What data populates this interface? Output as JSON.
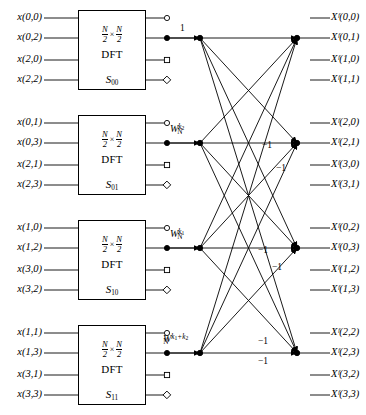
{
  "diagram": {
    "type": "signal-flow-graph",
    "colors": {
      "line": "#000000",
      "background": "#ffffff",
      "node": "#000000"
    },
    "geometry": {
      "width": 366,
      "height": 415,
      "block_left": 78,
      "block_right": 146,
      "stub_end_x": 168,
      "left_node_x": 200,
      "right_node_x": 297,
      "out_line_start_x": 310,
      "out_label_x": 328,
      "group_tops": [
        10,
        115,
        220,
        325
      ],
      "row_offsets": [
        8,
        28,
        50,
        70
      ]
    }
  },
  "blocks": [
    {
      "id": "S00",
      "size_num": "N",
      "size_den": "2",
      "times": "×",
      "dft_word": "DFT",
      "name_base": "S",
      "name_sub": "00",
      "inputs": [
        "x(0,0)",
        "x(0,2)",
        "x(2,0)",
        "x(2,2)"
      ],
      "terminals": [
        "circle",
        "dot",
        "square",
        "diamond"
      ],
      "twiddle": {
        "base": "W",
        "sub": "N",
        "sup": "1",
        "plain": true,
        "text": "1"
      }
    },
    {
      "id": "S01",
      "size_num": "N",
      "size_den": "2",
      "times": "×",
      "dft_word": "DFT",
      "name_base": "S",
      "name_sub": "01",
      "inputs": [
        "x(0,1)",
        "x(0,3)",
        "x(2,1)",
        "x(2,3)"
      ],
      "terminals": [
        "circle",
        "dot",
        "square",
        "diamond"
      ],
      "twiddle": {
        "base": "W",
        "sub": "N",
        "sup": "k",
        "sup_sub": "2",
        "plain": false
      }
    },
    {
      "id": "S10",
      "size_num": "N",
      "size_den": "2",
      "times": "×",
      "dft_word": "DFT",
      "name_base": "S",
      "name_sub": "10",
      "inputs": [
        "x(1,0)",
        "x(1,2)",
        "x(3,0)",
        "x(3,2)"
      ],
      "terminals": [
        "circle",
        "dot",
        "square",
        "diamond"
      ],
      "twiddle": {
        "base": "W",
        "sub": "N",
        "sup": "k",
        "sup_sub": "1",
        "plain": false
      }
    },
    {
      "id": "S11",
      "size_num": "N",
      "size_den": "2",
      "times": "×",
      "dft_word": "DFT",
      "name_base": "S",
      "name_sub": "11",
      "inputs": [
        "x(1,1)",
        "x(1,3)",
        "x(3,1)",
        "x(3,3)"
      ],
      "terminals": [
        "circle",
        "dot",
        "square",
        "diamond"
      ],
      "twiddle": {
        "base": "W",
        "sub": "N",
        "sup": "k",
        "sup_sub": "1",
        "sup_tail": "+k",
        "sup_tail_sub": "2",
        "plain": false
      }
    }
  ],
  "outputs": {
    "symbol": "X",
    "superscript": "F",
    "groups": [
      {
        "labels": [
          "Xᶠ(0,0)",
          "Xᶠ(0,1)",
          "Xᶠ(1,0)",
          "Xᶠ(1,1)"
        ],
        "indices": [
          "(0,0)",
          "(0,1)",
          "(1,0)",
          "(1,1)"
        ]
      },
      {
        "labels": [
          "Xᶠ(2,0)",
          "Xᶠ(2,1)",
          "Xᶠ(3,0)",
          "Xᶠ(3,1)"
        ],
        "indices": [
          "(2,0)",
          "(2,1)",
          "(3,0)",
          "(3,1)"
        ]
      },
      {
        "labels": [
          "Xᶠ(0,2)",
          "Xᶠ(0,3)",
          "Xᶠ(1,2)",
          "Xᶠ(1,3)"
        ],
        "indices": [
          "(0,2)",
          "(0,3)",
          "(1,2)",
          "(1,3)"
        ]
      },
      {
        "labels": [
          "Xᶠ(2,2)",
          "Xᶠ(2,3)",
          "Xᶠ(3,2)",
          "Xᶠ(3,3)"
        ],
        "indices": [
          "(2,2)",
          "(2,3)",
          "(3,2)",
          "(3,3)"
        ]
      }
    ]
  },
  "annotations": {
    "unity": "1",
    "minus_one": "−1",
    "minus_one_positions": [
      {
        "x": 262,
        "y": 140
      },
      {
        "x": 276,
        "y": 163
      },
      {
        "x": 258,
        "y": 245
      },
      {
        "x": 272,
        "y": 262
      },
      {
        "x": 258,
        "y": 338
      },
      {
        "x": 258,
        "y": 358
      }
    ]
  }
}
